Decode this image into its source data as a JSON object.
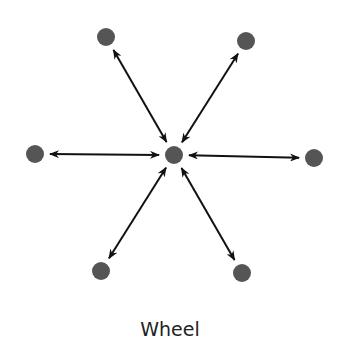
{
  "diagram": {
    "title": "Wheel",
    "node_color": "#555555",
    "arrow_color": "#111111",
    "center": {
      "id": "center",
      "x": 174,
      "y": 155
    },
    "nodes": [
      {
        "id": "top-left",
        "x": 106,
        "y": 37
      },
      {
        "id": "top-right",
        "x": 246,
        "y": 41
      },
      {
        "id": "left",
        "x": 35,
        "y": 154
      },
      {
        "id": "right",
        "x": 314,
        "y": 158
      },
      {
        "id": "bottom-left",
        "x": 101,
        "y": 271
      },
      {
        "id": "bottom-right",
        "x": 242,
        "y": 273
      }
    ],
    "edges": [
      {
        "from": "center",
        "to": "top-left",
        "bidirectional": true
      },
      {
        "from": "center",
        "to": "top-right",
        "bidirectional": true
      },
      {
        "from": "center",
        "to": "left",
        "bidirectional": true
      },
      {
        "from": "center",
        "to": "right",
        "bidirectional": true
      },
      {
        "from": "center",
        "to": "bottom-left",
        "bidirectional": true
      },
      {
        "from": "center",
        "to": "bottom-right",
        "bidirectional": true
      }
    ]
  }
}
